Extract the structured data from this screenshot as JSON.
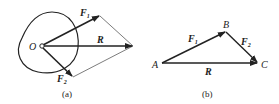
{
  "figure_a": {
    "caption": "(a)",
    "origin_label": "O",
    "vectors": [
      {
        "name": "F",
        "sub": "1"
      },
      {
        "name": "R",
        "sub": ""
      },
      {
        "name": "F",
        "sub": "2"
      }
    ]
  },
  "figure_b": {
    "caption": "(b)",
    "points": [
      "A",
      "B",
      "C"
    ],
    "vectors": [
      {
        "name": "F",
        "sub": "1"
      },
      {
        "name": "F",
        "sub": "2"
      },
      {
        "name": "R",
        "sub": ""
      }
    ]
  }
}
